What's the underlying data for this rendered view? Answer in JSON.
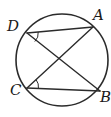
{
  "figure": {
    "type": "geometry-diagram",
    "background_color": "#ffffff",
    "stroke_color": "#2b2b2b",
    "label_color": "#1a1a1a"
  },
  "circle": {
    "name": "circumscribed-circle",
    "center_x": 62,
    "center_y": 60,
    "radius": 46,
    "stroke_width": 1.6
  },
  "points": [
    {
      "id": "A",
      "label": "A",
      "x": 93,
      "y": 27,
      "label_x": 93,
      "label_y": 8
    },
    {
      "id": "B",
      "label": "B",
      "x": 100,
      "y": 91,
      "label_x": 100,
      "label_y": 90
    },
    {
      "id": "C",
      "label": "C",
      "x": 27,
      "y": 88,
      "label_x": 10,
      "label_y": 83
    },
    {
      "id": "D",
      "label": "D",
      "x": 27,
      "y": 33,
      "label_x": 7,
      "label_y": 19
    }
  ],
  "chords": [
    {
      "id": "DA",
      "from": "D",
      "to": "A",
      "x1": 27,
      "y1": 33,
      "x2": 93,
      "y2": 27,
      "stroke_width": 1.4
    },
    {
      "id": "DB",
      "from": "D",
      "to": "B",
      "x1": 27,
      "y1": 33,
      "x2": 100,
      "y2": 91,
      "stroke_width": 1.4
    },
    {
      "id": "CA",
      "from": "C",
      "to": "A",
      "x1": 27,
      "y1": 88,
      "x2": 93,
      "y2": 27,
      "stroke_width": 1.4
    },
    {
      "id": "CB",
      "from": "C",
      "to": "B",
      "x1": 27,
      "y1": 88,
      "x2": 100,
      "y2": 91,
      "stroke_width": 1.4
    }
  ],
  "angle_marks": [
    {
      "id": "angle-at-D",
      "vertex": "D",
      "between": [
        "DA",
        "DB"
      ],
      "path": "M 38.2 32.0 A 11.5 11.5 0 0 1 34.8 41.5",
      "stroke_width": 1.0
    },
    {
      "id": "angle-at-C",
      "vertex": "C",
      "between": [
        "CA",
        "CB"
      ],
      "path": "M 36.2 79.8 A 11.5 11.5 0 0 1 38.4 88.3",
      "stroke_width": 1.0
    }
  ],
  "intersection": {
    "id": "chord-intersection",
    "x": 62,
    "y": 58
  }
}
